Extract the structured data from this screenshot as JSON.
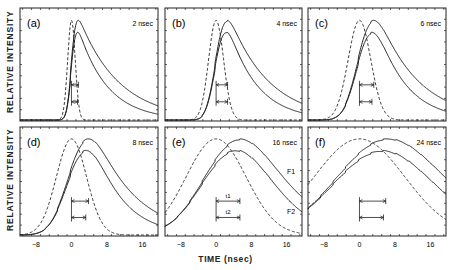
{
  "chart_data": [
    {
      "panel": "(a)",
      "type": "line",
      "pulse_width_label": "2 nsec",
      "pulse_fwhm": 2,
      "series": [
        {
          "name": "laser pulse",
          "style": "dashed"
        },
        {
          "name": "F1",
          "style": "solid"
        },
        {
          "name": "F2",
          "style": "solid"
        }
      ],
      "markers": [
        "t1",
        "t2"
      ],
      "xlim": [
        -11.6,
        19.5
      ]
    },
    {
      "panel": "(b)",
      "type": "line",
      "pulse_width_label": "4 nsec",
      "pulse_fwhm": 4,
      "series": [
        {
          "name": "laser pulse",
          "style": "dashed"
        },
        {
          "name": "F1",
          "style": "solid"
        },
        {
          "name": "F2",
          "style": "solid"
        }
      ],
      "markers": [
        "t1",
        "t2"
      ],
      "xlim": [
        -11.6,
        19.5
      ]
    },
    {
      "panel": "(c)",
      "type": "line",
      "pulse_width_label": "6 nsec",
      "pulse_fwhm": 6,
      "series": [
        {
          "name": "laser pulse",
          "style": "dashed"
        },
        {
          "name": "F1",
          "style": "solid"
        },
        {
          "name": "F2",
          "style": "solid"
        }
      ],
      "markers": [
        "t1",
        "t2"
      ],
      "xlim": [
        -11.6,
        19.5
      ]
    },
    {
      "panel": "(d)",
      "type": "line",
      "pulse_width_label": "8 nsec",
      "pulse_fwhm": 8,
      "series": [
        {
          "name": "laser pulse",
          "style": "dashed"
        },
        {
          "name": "F1",
          "style": "solid"
        },
        {
          "name": "F2",
          "style": "solid"
        }
      ],
      "markers": [
        "t1",
        "t2"
      ],
      "xlim": [
        -11.6,
        19.5
      ]
    },
    {
      "panel": "(e)",
      "type": "line",
      "pulse_width_label": "16 nsec",
      "pulse_fwhm": 16,
      "series": [
        {
          "name": "laser pulse",
          "style": "dashed"
        },
        {
          "name": "F1",
          "style": "solid"
        },
        {
          "name": "F2",
          "style": "solid"
        }
      ],
      "markers": [
        "t1",
        "t2"
      ],
      "curve_labels": [
        "F1",
        "F2"
      ],
      "marker_labels": [
        "t1",
        "t2"
      ],
      "xlim": [
        -11.6,
        19.5
      ]
    },
    {
      "panel": "(f)",
      "type": "line",
      "pulse_width_label": "24 nsec",
      "pulse_fwhm": 24,
      "series": [
        {
          "name": "laser pulse",
          "style": "dashed"
        },
        {
          "name": "F1",
          "style": "solid"
        },
        {
          "name": "F2",
          "style": "solid"
        }
      ],
      "markers": [
        "t1",
        "t2"
      ],
      "xlim": [
        -11.6,
        19.5
      ]
    }
  ],
  "axes": {
    "ylabel": "RELATIVE INTENSITY",
    "xlabel": "TIME (nsec)",
    "xticks": [
      -8,
      0,
      8,
      16
    ]
  }
}
